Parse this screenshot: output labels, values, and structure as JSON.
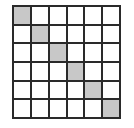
{
  "grid": {
    "rows": 6,
    "cols": 6,
    "shaded_color": "#c8c8c8",
    "empty_color": "#ffffff",
    "line_color": "#2a2a2a",
    "shaded_cells": [
      [
        0,
        0
      ],
      [
        1,
        1
      ],
      [
        2,
        2
      ],
      [
        3,
        3
      ],
      [
        4,
        4
      ],
      [
        5,
        5
      ]
    ]
  }
}
